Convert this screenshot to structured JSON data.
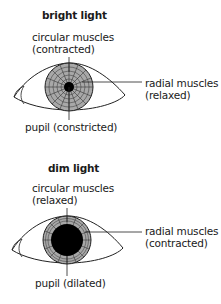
{
  "panels": [
    {
      "title": "bright light",
      "circular_label": [
        "circular muscles",
        "(contracted)"
      ],
      "radial_label": [
        "radial muscles",
        "(relaxed)"
      ],
      "pupil_label": "pupil (constricted)",
      "pupil_state": "constricted"
    },
    {
      "title": "dim light",
      "circular_label": [
        "circular muscles",
        "(relaxed)"
      ],
      "radial_label": [
        "radial muscles",
        "(contracted)"
      ],
      "pupil_label": "pupil (dilated)",
      "pupil_state": "dilated"
    }
  ],
  "colors": {
    "iris": "#a8a8a8",
    "pupil": "#000000",
    "line": "#222222"
  }
}
